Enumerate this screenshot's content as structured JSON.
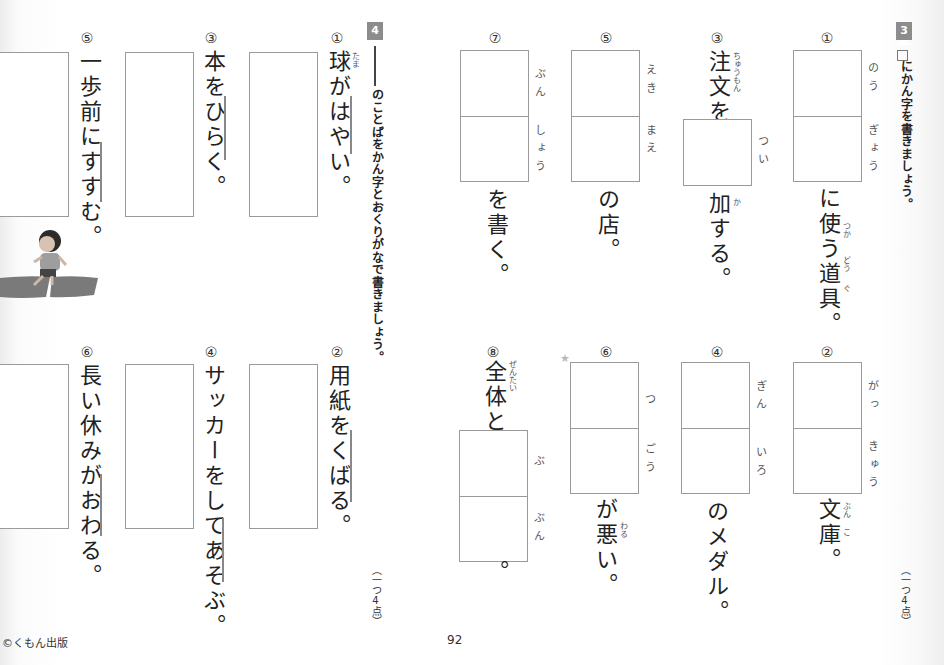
{
  "section3": {
    "badge": "3",
    "instruction": "にかん字を書きましょう。",
    "points": "（一つ4点）",
    "items": [
      {
        "number": "①",
        "prefix": "",
        "reading": [
          "のう",
          "ぎょう"
        ],
        "suffix": "に使う道具。",
        "suffix_ruby": [
          "つか",
          "どう",
          "ぐ"
        ]
      },
      {
        "number": "②",
        "prefix": "",
        "reading": [
          "がっ",
          "きゅう"
        ],
        "suffix": "文庫。",
        "suffix_ruby": [
          "ぶん",
          "こ"
        ]
      },
      {
        "number": "③",
        "prefix": "注文を",
        "prefix_ruby": "ちゅうもん",
        "reading": [
          "つい"
        ],
        "suffix": "加する。",
        "suffix_ruby": [
          "か"
        ]
      },
      {
        "number": "④",
        "prefix": "",
        "reading": [
          "ぎん",
          "いろ"
        ],
        "suffix": "のメダル。"
      },
      {
        "number": "⑤",
        "prefix": "",
        "reading": [
          "えき",
          "まえ"
        ],
        "suffix": "の店。"
      },
      {
        "number": "⑥",
        "prefix": "",
        "reading": [
          "つ",
          "ごう"
        ],
        "suffix": "が悪い。",
        "suffix_ruby": [
          "わる"
        ],
        "star": "★"
      },
      {
        "number": "⑦",
        "prefix": "",
        "reading": [
          "ぶん",
          "しょう"
        ],
        "suffix": "を書く。"
      },
      {
        "number": "⑧",
        "prefix": "全体と",
        "prefix_ruby": "ぜんたい",
        "reading": [
          "ぶ",
          "ぶん"
        ],
        "suffix": "。"
      }
    ]
  },
  "section4": {
    "badge": "4",
    "instruction": "のことばをかん字とおくりがなで書きましょう。",
    "points": "（一つ4点）",
    "items": [
      {
        "number": "①",
        "sentence": "球がはやい。",
        "ruby": "たま"
      },
      {
        "number": "②",
        "sentence": "用紙をくばる。"
      },
      {
        "number": "③",
        "sentence": "本をひらく。"
      },
      {
        "number": "④",
        "sentence": "サッカーをしてあそぶ。"
      },
      {
        "number": "⑤",
        "sentence": "一歩前にすすむ。"
      },
      {
        "number": "⑥",
        "sentence": "長い休みがおわる。"
      }
    ]
  },
  "footer": {
    "copyright": "©くもん出版",
    "page_number": "92"
  },
  "illustration": {
    "label": "walking-boy-illustration"
  }
}
